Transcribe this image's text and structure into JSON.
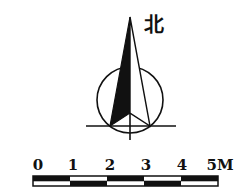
{
  "compass": {
    "label": "北",
    "icon": "north-arrow-icon"
  },
  "scale_bar": {
    "labels": [
      "0",
      "1",
      "2",
      "3",
      "4",
      "5M"
    ],
    "unit": "M",
    "segments": 5,
    "colors": {
      "ink": "#111111",
      "paper": "#ffffff"
    }
  }
}
